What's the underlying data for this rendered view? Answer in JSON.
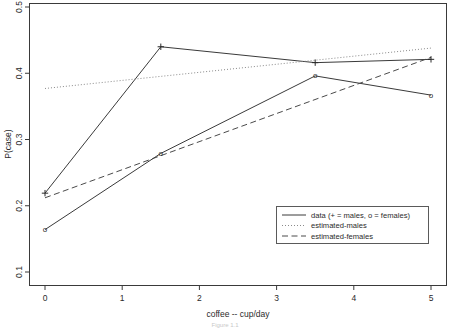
{
  "chart_data": {
    "type": "line",
    "title": "",
    "xlabel": "coffee -- cup/day",
    "ylabel": "P(case)",
    "xlim": [
      -0.28,
      5.28
    ],
    "ylim": [
      0.092,
      0.513
    ],
    "xticks": [
      0,
      1,
      2,
      3,
      4,
      5
    ],
    "xticklabels": [
      "0",
      "1",
      "2",
      "3",
      "4",
      "5"
    ],
    "yticks": [
      0.1,
      0.2,
      0.3,
      0.4,
      0.5
    ],
    "yticklabels": [
      "0.1",
      "0.2",
      "0.3",
      "0.4",
      "0.5"
    ],
    "grid": false,
    "legend_position": "lower right",
    "series": [
      {
        "name": "data (+ = males, o = females)",
        "style": "solid",
        "marker": "plus",
        "group": "males",
        "x": [
          0,
          1.5,
          3.5,
          5
        ],
        "values": [
          0.219,
          0.44,
          0.416,
          0.421
        ]
      },
      {
        "name": "data (+ = males, o = females)",
        "style": "solid",
        "marker": "circle",
        "group": "females",
        "x": [
          0,
          1.5,
          3.5,
          5
        ],
        "values": [
          0.164,
          0.279,
          0.396,
          0.367
        ]
      },
      {
        "name": "estimated-males",
        "style": "dotted",
        "marker": "none",
        "x": [
          0,
          5
        ],
        "values": [
          0.377,
          0.438
        ]
      },
      {
        "name": "estimated-females",
        "style": "dashed",
        "marker": "none",
        "x": [
          0,
          5
        ],
        "values": [
          0.212,
          0.424
        ]
      }
    ]
  },
  "legend": {
    "entries": [
      {
        "label": "data (+ = males, o = females)",
        "style": "solid"
      },
      {
        "label": "estimated-males",
        "style": "dotted"
      },
      {
        "label": "estimated-females",
        "style": "dashed"
      }
    ]
  },
  "caption": "Figure 1.1",
  "colors": {
    "axis": "#3a3a3a",
    "data_line": "#3a3a3a",
    "estimated_males": "#8a8a8a",
    "estimated_females": "#4a4a4a",
    "legend_border": "#5a5a5a",
    "background": "#ffffff"
  }
}
